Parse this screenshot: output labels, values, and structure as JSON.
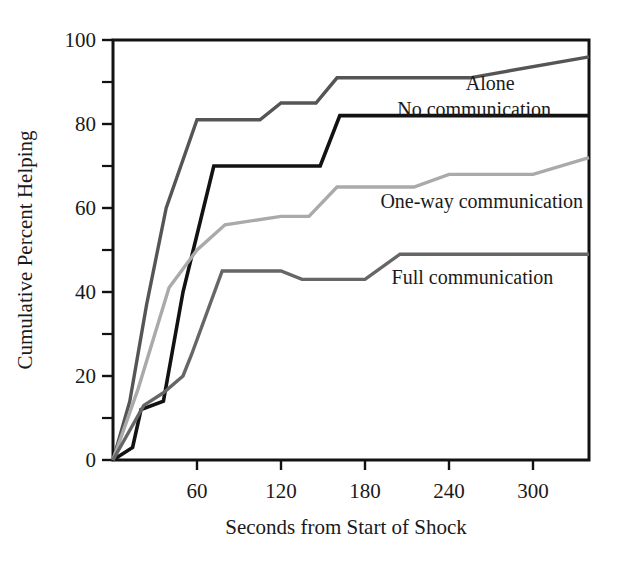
{
  "figure": {
    "background": "#ffffff",
    "frame_color": "#121212"
  },
  "chart_data": {
    "type": "line",
    "title": "",
    "xlabel": "Seconds from Start of Shock",
    "ylabel": "Cumulative Percent Helping",
    "xlim": [
      0,
      340
    ],
    "ylim": [
      0,
      100
    ],
    "grid": false,
    "legend_position": "inline-labels",
    "x_ticks": [
      60,
      120,
      180,
      240,
      300
    ],
    "x_tick_labels": [
      "60",
      "120",
      "180",
      "240",
      "300"
    ],
    "x_minor_ticks": [],
    "y_ticks": [
      0,
      20,
      40,
      60,
      80,
      100
    ],
    "y_tick_labels": [
      "0",
      "20",
      "40",
      "60",
      "80",
      "100"
    ],
    "y_minor_ticks": [
      10,
      30,
      50,
      70,
      90
    ],
    "series": [
      {
        "name": "Alone",
        "color": "#555555",
        "width": 3.4,
        "label_x": 252,
        "label_y": 88,
        "x": [
          0,
          12,
          24,
          38,
          60,
          105,
          120,
          145,
          160,
          255,
          340
        ],
        "values": [
          0,
          14,
          37,
          60,
          81,
          81,
          85,
          85,
          91,
          91,
          96
        ]
      },
      {
        "name": "No communication",
        "color": "#121212",
        "width": 3.6,
        "label_x": 203,
        "label_y": 82,
        "x": [
          0,
          14,
          20,
          36,
          50,
          72,
          120,
          148,
          162,
          340
        ],
        "values": [
          0,
          3,
          12,
          14,
          40,
          70,
          70,
          70,
          82,
          82
        ]
      },
      {
        "name": "One-way communication",
        "color": "#aaaaaa",
        "width": 3.4,
        "label_x": 191,
        "label_y": 60,
        "x": [
          0,
          18,
          40,
          60,
          80,
          120,
          140,
          160,
          215,
          240,
          300,
          340
        ],
        "values": [
          0,
          17,
          41,
          50,
          56,
          58,
          58,
          65,
          65,
          68,
          68,
          72
        ]
      },
      {
        "name": "Full communication",
        "color": "#666666",
        "width": 3.4,
        "label_x": 199,
        "label_y": 42,
        "x": [
          0,
          22,
          36,
          50,
          56,
          78,
          120,
          135,
          180,
          205,
          340
        ],
        "values": [
          0,
          13,
          16,
          20,
          25,
          45,
          45,
          43,
          43,
          49,
          49
        ]
      }
    ]
  }
}
